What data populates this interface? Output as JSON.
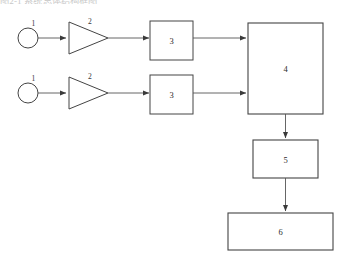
{
  "figure": {
    "type": "block-diagram",
    "title_partial_clipped": "图2-1 系统总体结构框图",
    "background_color": "#ffffff",
    "stroke_color": "#444444",
    "label_color": "#2b2b2b"
  },
  "nodes": [
    {
      "id": "source-1-top",
      "label": "1",
      "shape": "circle",
      "x": 28,
      "y": 38,
      "rx": 10,
      "ry": 10
    },
    {
      "id": "source-1-bottom",
      "label": "1",
      "shape": "circle",
      "x": 28,
      "y": 93,
      "rx": 10,
      "ry": 10
    },
    {
      "id": "amp-2-top",
      "label": "2",
      "shape": "triangle",
      "x": 88,
      "y": 38,
      "w": 40,
      "h": 32
    },
    {
      "id": "amp-2-bottom",
      "label": "2",
      "shape": "triangle",
      "x": 88,
      "y": 93,
      "w": 40,
      "h": 32
    },
    {
      "id": "block-3-top",
      "label": "3",
      "shape": "rectangle",
      "x": 171,
      "y": 40,
      "w": 43,
      "h": 39
    },
    {
      "id": "block-3-bottom",
      "label": "3",
      "shape": "rectangle",
      "x": 171,
      "y": 94,
      "w": 43,
      "h": 39
    },
    {
      "id": "block-4",
      "label": "4",
      "shape": "rectangle",
      "x": 285,
      "y": 68,
      "w": 75,
      "h": 91
    },
    {
      "id": "block-5",
      "label": "5",
      "shape": "rectangle",
      "x": 285,
      "y": 159,
      "w": 65,
      "h": 38
    },
    {
      "id": "block-6",
      "label": "6",
      "shape": "rectangle",
      "x": 280,
      "y": 231,
      "w": 105,
      "h": 37
    }
  ],
  "edges": [
    {
      "id": "edge-source-top-to-amp-top",
      "from": "source-1-top",
      "to": "amp-2-top",
      "arrow": true
    },
    {
      "id": "edge-amp-top-to-block3-top",
      "from": "amp-2-top",
      "to": "block-3-top",
      "arrow": true
    },
    {
      "id": "edge-block3-top-to-block4",
      "from": "block-3-top",
      "to": "block-4",
      "arrow": true
    },
    {
      "id": "edge-source-bot-to-amp-bot",
      "from": "source-1-bottom",
      "to": "amp-2-bottom",
      "arrow": true
    },
    {
      "id": "edge-amp-bot-to-block3-bot",
      "from": "amp-2-bottom",
      "to": "block-3-bottom",
      "arrow": true
    },
    {
      "id": "edge-block3-bot-to-block4",
      "from": "block-3-bottom",
      "to": "block-4",
      "arrow": true
    },
    {
      "id": "edge-block4-to-block5",
      "from": "block-4",
      "to": "block-5",
      "arrow": true
    },
    {
      "id": "edge-block5-to-block6",
      "from": "block-5",
      "to": "block-6",
      "arrow": true
    }
  ]
}
